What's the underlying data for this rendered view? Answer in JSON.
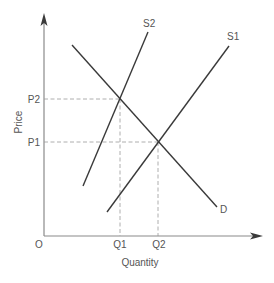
{
  "diagram": {
    "type": "supply-demand",
    "axes": {
      "x_label": "Quantity",
      "y_label": "Price",
      "origin_label": "O"
    },
    "curves": [
      {
        "id": "S2",
        "label": "S2",
        "kind": "supply"
      },
      {
        "id": "S1",
        "label": "S1",
        "kind": "supply"
      },
      {
        "id": "D",
        "label": "D",
        "kind": "demand"
      }
    ],
    "price_levels": [
      {
        "label": "P2",
        "note": "equilibrium of S2 and D"
      },
      {
        "label": "P1",
        "note": "equilibrium of S1 and D"
      }
    ],
    "quantity_levels": [
      {
        "label": "Q1",
        "note": "equilibrium of S2 and D"
      },
      {
        "label": "Q2",
        "note": "equilibrium of S1 and D"
      }
    ],
    "colors": {
      "curve": "#3a3a3a",
      "axis": "#8a8a8a",
      "guide": "#9a9a9a",
      "text": "#555555"
    }
  }
}
